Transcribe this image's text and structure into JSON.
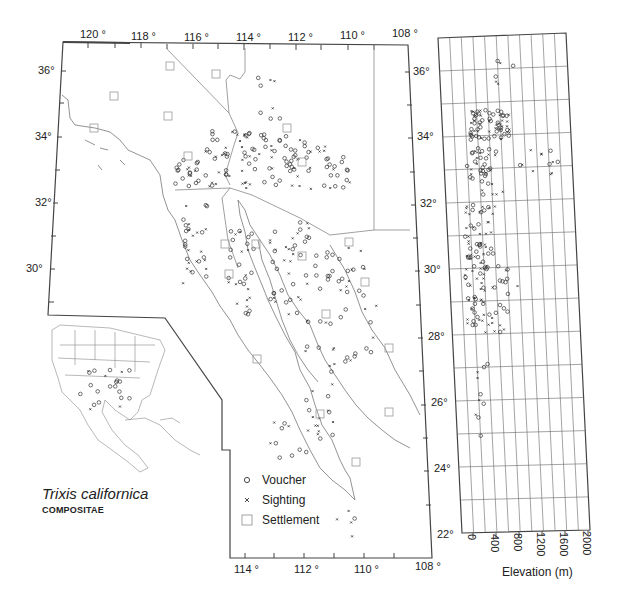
{
  "title": {
    "species": "Trixis californica",
    "family": "COMPOSITAE"
  },
  "legend": {
    "items": [
      {
        "symbol": "circle-icon",
        "label": "Voucher"
      },
      {
        "symbol": "cross-icon",
        "label": "Sighting"
      },
      {
        "symbol": "square-icon",
        "label": "Settlement"
      }
    ]
  },
  "main_map": {
    "top_longitude_labels": [
      "120 °",
      "118 °",
      "116 °",
      "114 °",
      "112 °",
      "110 °",
      "108 °"
    ],
    "bottom_longitude_labels": [
      "114 °",
      "112 °",
      "110 °",
      "108 °"
    ],
    "left_latitude_labels": [
      "36°",
      "34°",
      "32°",
      "30°"
    ],
    "right_latitude_labels": [
      "36°",
      "34°",
      "32°",
      "30°",
      "28°",
      "26°",
      "24°",
      "22°"
    ]
  },
  "elevation_panel": {
    "x_axis_label": "Elevation (m)",
    "x_tick_labels": [
      "0",
      "400",
      "800",
      "1200",
      "1600",
      "2000"
    ],
    "latitude_range": [
      22,
      37
    ]
  },
  "inset_map": {
    "region": "North America and Caribbean",
    "description": "Overview map of USA, Mexico, Central America and Caribbean with voucher/sighting points"
  },
  "colors": {
    "ink": "#222222",
    "border": "#444444",
    "coast": "#666666",
    "grid": "#555555",
    "background": "#ffffff"
  }
}
